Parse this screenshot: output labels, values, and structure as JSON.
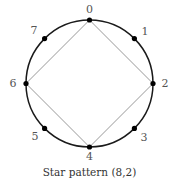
{
  "diagram": {
    "caption": "Star pattern (8,2)",
    "n": 8,
    "step": 2,
    "center": [
      89.5,
      83.5
    ],
    "radius": 63.5,
    "points": [
      {
        "label": "0",
        "x": 89.5,
        "y": 20.0,
        "lx": 89.5,
        "ly": 13
      },
      {
        "label": "1",
        "x": 134.4,
        "y": 38.6,
        "lx": 145,
        "ly": 35
      },
      {
        "label": "2",
        "x": 153.0,
        "y": 83.5,
        "lx": 165,
        "ly": 87
      },
      {
        "label": "3",
        "x": 134.4,
        "y": 128.4,
        "lx": 144,
        "ly": 141
      },
      {
        "label": "4",
        "x": 89.5,
        "y": 147.0,
        "lx": 89.5,
        "ly": 160
      },
      {
        "label": "5",
        "x": 44.6,
        "y": 128.4,
        "lx": 35,
        "ly": 140
      },
      {
        "label": "6",
        "x": 26.0,
        "y": 83.5,
        "lx": 13,
        "ly": 87
      },
      {
        "label": "7",
        "x": 44.6,
        "y": 38.6,
        "lx": 34,
        "ly": 34
      }
    ],
    "edges": [
      [
        0,
        2
      ],
      [
        2,
        4
      ],
      [
        4,
        6
      ],
      [
        6,
        0
      ]
    ],
    "colors": {
      "circle": "#1a1a1a",
      "edge": "#999999",
      "point": "#000000"
    }
  }
}
